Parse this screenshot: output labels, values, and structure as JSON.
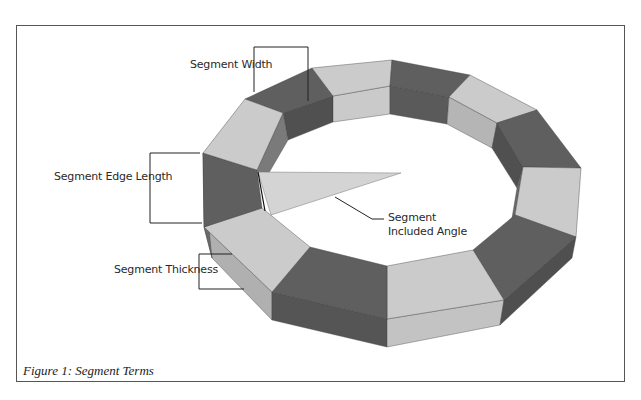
{
  "figure": {
    "caption": "Figure 1: Segment Terms",
    "labels": {
      "width": "Segment Width",
      "edge_length": "Segment Edge Length",
      "included_angle_line1": "Segment",
      "included_angle_line2": "Included Angle",
      "thickness": "Segment Thickness"
    },
    "colors": {
      "light_top": "#c9c9c9",
      "light_side": "#b4b4b4",
      "dark_top": "#606060",
      "dark_side": "#555555",
      "wedge": "#d6d6d6",
      "line": "#222222",
      "frame": "#555555"
    },
    "segment_count": 12
  }
}
